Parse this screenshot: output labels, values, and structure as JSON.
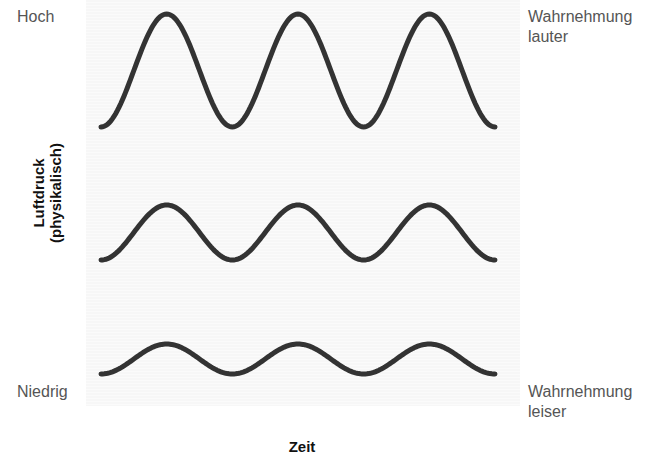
{
  "labels": {
    "high": "Hoch",
    "low": "Niedrig",
    "perception_louder_line1": "Wahrnehmung",
    "perception_louder_line2": "lauter",
    "perception_quieter_line1": "Wahrnehmung",
    "perception_quieter_line2": "leiser",
    "y_axis_line1": "Luftdruck",
    "y_axis_line2": "(physikalisch)",
    "x_axis": "Zeit"
  },
  "colors": {
    "wave": "#333333",
    "panel": "#f8f8f8",
    "text": "#555555",
    "axis_text": "#111111"
  },
  "chart_data": {
    "type": "line",
    "title": "",
    "xlabel": "Zeit",
    "ylabel": "Luftdruck (physikalisch)",
    "y_ticks": [
      "Hoch",
      "Niedrig"
    ],
    "right_annotations": [
      "Wahrnehmung lauter",
      "Wahrnehmung leiser"
    ],
    "series": [
      {
        "name": "loud",
        "cycles": 3,
        "relative_amplitude": 1.0,
        "x_start": 101,
        "x_end": 495,
        "y_top": 14,
        "y_bottom": 127
      },
      {
        "name": "medium",
        "cycles": 3,
        "relative_amplitude": 0.49,
        "x_start": 101,
        "x_end": 495,
        "y_top": 205,
        "y_bottom": 260
      },
      {
        "name": "quiet",
        "cycles": 3,
        "relative_amplitude": 0.27,
        "x_start": 101,
        "x_end": 495,
        "y_top": 344,
        "y_bottom": 374
      }
    ],
    "grid": false,
    "legend": "none"
  }
}
